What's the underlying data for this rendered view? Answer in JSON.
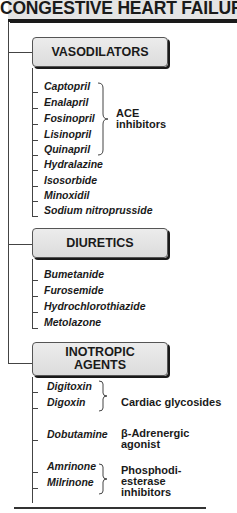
{
  "title": "CONGESTIVE HEART FAILURE",
  "categories": [
    {
      "label": "VASODILATORS",
      "items": [
        "Captopril",
        "Enalapril",
        "Fosinopril",
        "Lisinopril",
        "Quinapril",
        "Hydralazine",
        "Isosorbide",
        "Minoxidil",
        "Sodium nitroprusside"
      ],
      "groups": [
        {
          "label": "ACE\ninhibitors",
          "members": [
            "Captopril",
            "Enalapril",
            "Fosinopril",
            "Lisinopril",
            "Quinapril"
          ]
        }
      ]
    },
    {
      "label": "DIURETICS",
      "items": [
        "Bumetanide",
        "Furosemide",
        "Hydrochlorothiazide",
        "Metolazone"
      ],
      "groups": []
    },
    {
      "label": "INOTROPIC\nAGENTS",
      "items": [
        "Digitoxin",
        "Digoxin",
        "Dobutamine",
        "Amrinone",
        "Milrinone"
      ],
      "groups": [
        {
          "label": "Cardiac glycosides",
          "members": [
            "Digitoxin",
            "Digoxin"
          ]
        },
        {
          "label": "β-Adrenergic\nagonist",
          "members": [
            "Dobutamine"
          ]
        },
        {
          "label": "Phosphodi-\nesterase\ninhibitors",
          "members": [
            "Amrinone",
            "Milrinone"
          ]
        }
      ]
    }
  ]
}
